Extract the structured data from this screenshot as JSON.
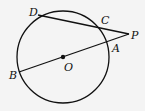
{
  "diagram": {
    "type": "geometry",
    "circle": {
      "center_label": "O",
      "cx": 63,
      "cy": 57,
      "r": 46
    },
    "points": [
      {
        "label": "D",
        "x": 38,
        "y": 15,
        "lx": 29,
        "ly": 16
      },
      {
        "label": "C",
        "x": 102,
        "y": 28,
        "lx": 101,
        "ly": 24
      },
      {
        "label": "P",
        "x": 129,
        "y": 34,
        "lx": 132,
        "ly": 38
      },
      {
        "label": "A",
        "x": 110,
        "y": 43,
        "lx": 112,
        "ly": 52
      },
      {
        "label": "B",
        "x": 19,
        "y": 72,
        "lx": 9,
        "ly": 78
      },
      {
        "label": "O",
        "x": 63,
        "y": 57,
        "lx": 64,
        "ly": 70
      }
    ],
    "segments": [
      {
        "from": "D",
        "to": "P"
      },
      {
        "from": "B",
        "to": "P"
      }
    ]
  }
}
